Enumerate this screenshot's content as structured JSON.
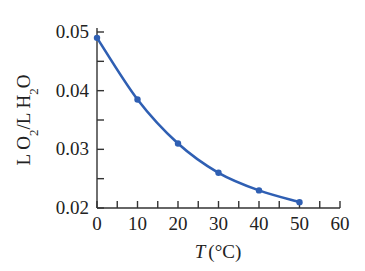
{
  "chart_data": {
    "type": "line",
    "title": "",
    "xlabel": "T (°C)",
    "ylabel": "L O2/L H2O",
    "x": [
      0,
      10,
      20,
      30,
      40,
      50
    ],
    "series": [
      {
        "name": "O2 solubility",
        "values": [
          0.049,
          0.0385,
          0.031,
          0.026,
          0.023,
          0.021
        ],
        "color": "#2f5fb3"
      }
    ],
    "xlim": [
      0,
      60
    ],
    "ylim": [
      0.02,
      0.05
    ],
    "xticks": [
      "0",
      "10",
      "20",
      "30",
      "40",
      "50",
      "60"
    ],
    "yticks": [
      "0.02",
      "0.03",
      "0.04",
      "0.05"
    ],
    "grid": false,
    "legend": "none"
  },
  "labels": {
    "x_italic": "T",
    "x_unit": "(°C)",
    "y_part1": "L O",
    "y_sub1": "2",
    "y_part2": "/L H",
    "y_sub2": "2",
    "y_part3": "O"
  }
}
